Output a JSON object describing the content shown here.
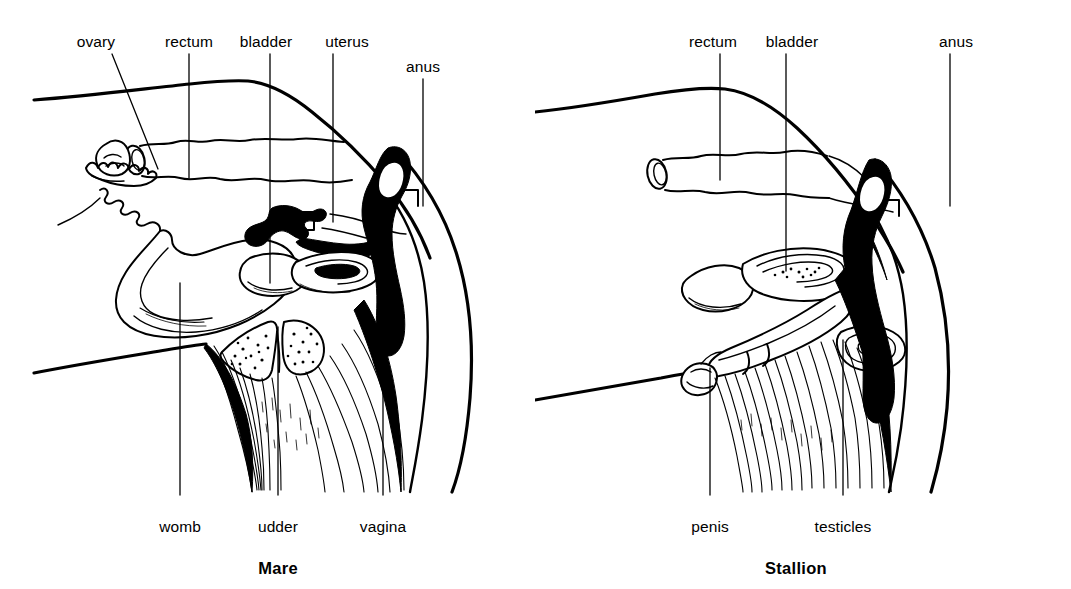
{
  "figure": {
    "type": "line-drawing-anatomical-diagram",
    "ink_color": "#000000",
    "background_color": "#ffffff",
    "panel_count": 2
  },
  "panels": [
    {
      "id": "mare",
      "caption": "Mare",
      "caption_x": 278,
      "caption_y": 568,
      "top_labels": [
        {
          "key": "ovary",
          "text": "ovary",
          "x": 96,
          "y": 42,
          "line_x1": 112,
          "line_y1": 54,
          "line_x2": 158,
          "line_y2": 169,
          "angled": true
        },
        {
          "key": "rectum",
          "text": "rectum",
          "x": 189,
          "y": 42,
          "line_x1": 189,
          "line_y1": 54,
          "line_x2": 189,
          "line_y2": 178,
          "angled": false
        },
        {
          "key": "bladder",
          "text": "bladder",
          "x": 266,
          "y": 42,
          "line_x1": 270,
          "line_y1": 54,
          "line_x2": 270,
          "line_y2": 283,
          "angled": false
        },
        {
          "key": "uterus",
          "text": "uterus",
          "x": 347,
          "y": 42,
          "line_x1": 333,
          "line_y1": 54,
          "line_x2": 333,
          "line_y2": 222,
          "angled": false
        },
        {
          "key": "anus",
          "text": "anus",
          "x": 423,
          "y": 67,
          "line_x1": 423,
          "line_y1": 79,
          "line_x2": 423,
          "line_y2": 206,
          "angled": false
        }
      ],
      "bottom_labels": [
        {
          "key": "womb",
          "text": "womb",
          "x": 180,
          "y": 527,
          "line_x1": 180,
          "line_y1": 283,
          "line_x2": 180,
          "line_y2": 495
        },
        {
          "key": "udder",
          "text": "udder",
          "x": 278,
          "y": 527,
          "line_x1": 278,
          "line_y1": 327,
          "line_x2": 278,
          "line_y2": 495
        },
        {
          "key": "vagina",
          "text": "vagina",
          "x": 383,
          "y": 527,
          "line_x1": 383,
          "line_y1": 239,
          "line_x2": 383,
          "line_y2": 495
        }
      ]
    },
    {
      "id": "stallion",
      "caption": "Stallion",
      "caption_x": 796,
      "caption_y": 568,
      "top_labels": [
        {
          "key": "rectum",
          "text": "rectum",
          "x": 713,
          "y": 42,
          "line_x1": 720,
          "line_y1": 54,
          "line_x2": 720,
          "line_y2": 180,
          "angled": false
        },
        {
          "key": "bladder",
          "text": "bladder",
          "x": 792,
          "y": 42,
          "line_x1": 786,
          "line_y1": 54,
          "line_x2": 786,
          "line_y2": 271,
          "angled": false
        },
        {
          "key": "anus",
          "text": "anus",
          "x": 956,
          "y": 42,
          "line_x1": 950,
          "line_y1": 54,
          "line_x2": 950,
          "line_y2": 206,
          "angled": false
        }
      ],
      "bottom_labels": [
        {
          "key": "penis",
          "text": "penis",
          "x": 710,
          "y": 527,
          "line_x1": 710,
          "line_y1": 368,
          "line_x2": 710,
          "line_y2": 495
        },
        {
          "key": "testicles",
          "text": "testicles",
          "x": 843,
          "y": 527,
          "line_x1": 843,
          "line_y1": 340,
          "line_x2": 843,
          "line_y2": 495
        }
      ]
    }
  ]
}
